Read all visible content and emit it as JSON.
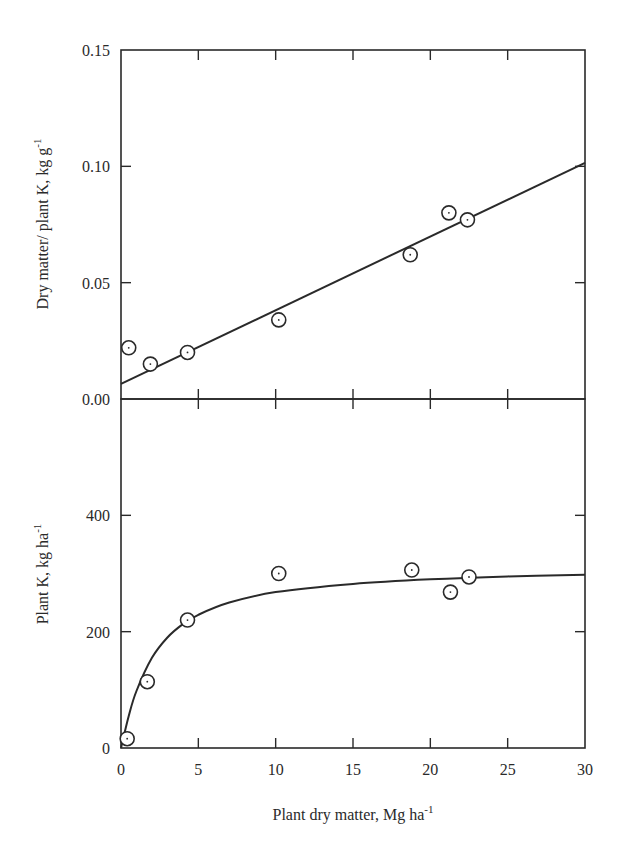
{
  "figure": {
    "x_axis_label": "Plant dry matter, Mg ha",
    "x_axis_label_sup": "-1"
  },
  "chart_data": [
    {
      "type": "scatter",
      "panel": "top",
      "title": "",
      "xlabel": "Plant dry matter, Mg ha^-1",
      "ylabel": "Dry matter/ plant K, kg g^-1",
      "ylabel_text": "Dry matter/ plant K, kg g",
      "ylabel_sup": "-1",
      "xlim": [
        0,
        30
      ],
      "ylim": [
        0,
        0.15
      ],
      "x_ticks": [
        0,
        5,
        10,
        15,
        20,
        25,
        30
      ],
      "y_ticks": [
        0.0,
        0.05,
        0.1,
        0.15
      ],
      "y_tick_labels": [
        "0.00",
        "0.05",
        "0.10",
        "0.15"
      ],
      "grid": false,
      "legend": null,
      "series": [
        {
          "name": "observed",
          "marker": "circle-dot",
          "x": [
            0.5,
            1.9,
            4.3,
            10.2,
            18.7,
            21.2,
            22.4
          ],
          "y": [
            0.022,
            0.015,
            0.02,
            0.034,
            0.062,
            0.08,
            0.077
          ]
        },
        {
          "name": "linear fit",
          "style": "line",
          "x": [
            0,
            30
          ],
          "y": [
            0.0065,
            0.1015
          ]
        }
      ]
    },
    {
      "type": "scatter",
      "panel": "bottom",
      "title": "",
      "xlabel": "Plant dry matter, Mg ha^-1",
      "ylabel": "Plant K, kg ha^-1",
      "ylabel_text": "Plant K, kg ha",
      "ylabel_sup": "-1",
      "xlim": [
        0,
        30
      ],
      "ylim": [
        0,
        600
      ],
      "x_ticks": [
        0,
        5,
        10,
        15,
        20,
        25,
        30
      ],
      "x_tick_labels": [
        "0",
        "5",
        "10",
        "15",
        "20",
        "25",
        "30"
      ],
      "y_ticks": [
        0,
        200,
        400
      ],
      "y_tick_labels": [
        "0",
        "200",
        "400"
      ],
      "grid": false,
      "legend": null,
      "series": [
        {
          "name": "observed",
          "marker": "circle-dot",
          "x": [
            0.4,
            1.7,
            4.3,
            10.2,
            18.8,
            21.3,
            22.5
          ],
          "y": [
            16,
            114,
            220,
            300,
            306,
            268,
            294
          ]
        },
        {
          "name": "hyperbolic fit",
          "style": "curve",
          "x": [
            0,
            0.5,
            1,
            2,
            3,
            4,
            5,
            7,
            10,
            15,
            20,
            25,
            30
          ],
          "y": [
            0,
            55,
            98,
            155,
            190,
            213,
            229,
            250,
            268,
            282,
            290,
            295,
            298
          ]
        }
      ]
    }
  ]
}
